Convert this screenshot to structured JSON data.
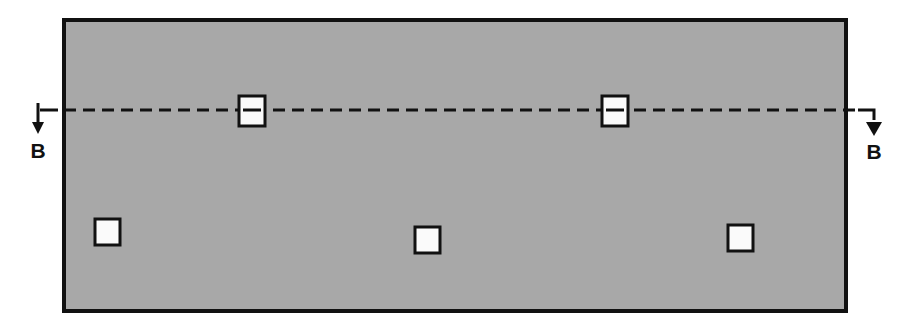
{
  "drawing": {
    "title": "Section B-B plan view of panel with openings",
    "type": "engineering-section-drawing",
    "canvas": {
      "width": 908,
      "height": 327
    },
    "colors": {
      "background": "#ffffff",
      "panel_fill": "#a8a8a8",
      "outline": "#111111",
      "opening_fill": "#fafafa",
      "centerline": "#111111"
    },
    "panel": {
      "label": "main-panel",
      "x": 62,
      "y": 18,
      "width": 786,
      "height": 295,
      "stroke_width": 4
    },
    "section_line": {
      "label": "section-cut-line",
      "y": 110,
      "dash_pattern": "12 7",
      "stroke_width": 3,
      "start_x": 36,
      "end_x": 880,
      "stub_left_x1": 40,
      "stub_left_x2": 58
    },
    "section_markers": [
      {
        "name": "section-marker-left",
        "letter": "B",
        "arrow_x": 38,
        "arrow_y_top": 104,
        "arrow_y_bottom": 131,
        "letter_x": 38,
        "letter_y": 156,
        "elbow": false
      },
      {
        "name": "section-marker-right",
        "letter": "B",
        "arrow_x": 874,
        "arrow_y_top": 112,
        "arrow_y_bottom": 133,
        "letter_x": 874,
        "letter_y": 157,
        "elbow": true,
        "elbow_from_x": 858,
        "elbow_y": 110
      }
    ],
    "openings_on_centerline": [
      {
        "name": "opening-top-1",
        "x": 238,
        "y": 95,
        "width": 27,
        "height": 31
      },
      {
        "name": "opening-top-2",
        "x": 601,
        "y": 95,
        "width": 27,
        "height": 31
      }
    ],
    "openings_lower_row": [
      {
        "name": "opening-bottom-1",
        "x": 94,
        "y": 218,
        "width": 26,
        "height": 27
      },
      {
        "name": "opening-bottom-2",
        "x": 414,
        "y": 226,
        "width": 26,
        "height": 27
      },
      {
        "name": "opening-bottom-3",
        "x": 727,
        "y": 224,
        "width": 26,
        "height": 27
      }
    ],
    "counts": {
      "openings_total": 5,
      "openings_on_centerline": 2,
      "openings_lower_row": 3
    }
  }
}
